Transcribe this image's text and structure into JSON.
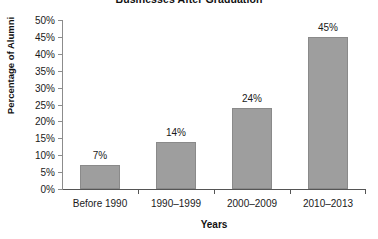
{
  "chart_data": {
    "type": "bar",
    "title": "Businesses After Graduation",
    "xlabel": "Years",
    "ylabel": "Percentage of Alumni",
    "categories": [
      "Before 1990",
      "1990–1999",
      "2000–2009",
      "2010–2013"
    ],
    "values": [
      7,
      14,
      24,
      45
    ],
    "value_labels": [
      "7%",
      "14%",
      "24%",
      "45%"
    ],
    "ylim": [
      0,
      50
    ],
    "ytick_step": 5,
    "ytick_labels": [
      "0%",
      "5%",
      "10%",
      "15%",
      "20%",
      "25%",
      "30%",
      "35%",
      "40%",
      "45%",
      "50%"
    ],
    "ytick_values": [
      0,
      5,
      10,
      15,
      20,
      25,
      30,
      35,
      40,
      45,
      50
    ],
    "grid": false,
    "legend": false,
    "bar_color": "#9e9e9e",
    "bar_border_color": "#8a8a8a",
    "axis_color": "#555555",
    "text_color": "#1a1a1a",
    "title_clipped": true
  }
}
